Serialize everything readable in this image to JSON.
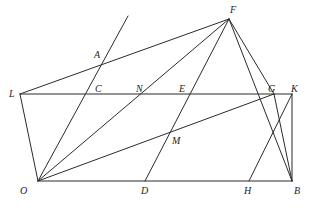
{
  "figure": {
    "width": 314,
    "height": 210,
    "background_color": "#ffffff",
    "stroke_color": "#2b2b2b",
    "label_color": "#1d1d1d",
    "stroke_width": 1,
    "label_font_size": 10,
    "points": {
      "L": {
        "label": "L",
        "x": 20,
        "y": 94,
        "label_x": 9,
        "label_y": 89
      },
      "O": {
        "label": "O",
        "x": 38,
        "y": 181,
        "label_x": 20,
        "label_y": 186
      },
      "A": {
        "label": "A",
        "x": 103,
        "y": 60,
        "label_x": 94,
        "label_y": 50
      },
      "C": {
        "label": "C",
        "x": 100,
        "y": 94,
        "label_x": 95,
        "label_y": 84
      },
      "N": {
        "label": "N",
        "x": 142,
        "y": 94,
        "label_x": 136,
        "label_y": 84
      },
      "E": {
        "label": "E",
        "x": 185,
        "y": 94,
        "label_x": 179,
        "label_y": 84
      },
      "M": {
        "label": "M",
        "x": 172,
        "y": 134,
        "label_x": 172,
        "label_y": 136
      },
      "D": {
        "label": "D",
        "x": 145,
        "y": 181,
        "label_x": 141,
        "label_y": 186
      },
      "H": {
        "label": "H",
        "x": 249,
        "y": 181,
        "label_x": 244,
        "label_y": 186
      },
      "B": {
        "label": "B",
        "x": 292,
        "y": 181,
        "label_x": 294,
        "label_y": 186
      },
      "F": {
        "label": "F",
        "x": 229,
        "y": 19,
        "label_x": 230,
        "label_y": 5
      },
      "G": {
        "label": "G",
        "x": 274,
        "y": 94,
        "label_x": 268,
        "label_y": 84
      },
      "K": {
        "label": "K",
        "x": 292,
        "y": 94,
        "label_x": 291,
        "label_y": 84
      },
      "T": {
        "label": "",
        "x": 128,
        "y": 16,
        "label_x": 0,
        "label_y": 0
      }
    },
    "segments": [
      {
        "name": "segment-L-F",
        "from": "L",
        "to": "F",
        "x1": 20,
        "y1": 94,
        "x2": 229,
        "y2": 19
      },
      {
        "name": "segment-L-K",
        "from": "L",
        "to": "K",
        "x1": 20,
        "y1": 94,
        "x2": 292,
        "y2": 94
      },
      {
        "name": "segment-L-O",
        "from": "L",
        "to": "O",
        "x1": 20,
        "y1": 94,
        "x2": 38,
        "y2": 181
      },
      {
        "name": "segment-O-B",
        "from": "O",
        "to": "B",
        "x1": 38,
        "y1": 181,
        "x2": 292,
        "y2": 181
      },
      {
        "name": "segment-K-B",
        "from": "K",
        "to": "B",
        "x1": 292,
        "y1": 94,
        "x2": 292,
        "y2": 181
      },
      {
        "name": "segment-F-G",
        "from": "F",
        "to": "G",
        "x1": 229,
        "y1": 19,
        "x2": 274,
        "y2": 94
      },
      {
        "name": "segment-F-B",
        "from": "F",
        "to": "B",
        "x1": 229,
        "y1": 19,
        "x2": 292,
        "y2": 181
      },
      {
        "name": "segment-F-O",
        "from": "F",
        "to": "O",
        "x1": 229,
        "y1": 19,
        "x2": 38,
        "y2": 181
      },
      {
        "name": "segment-F-D",
        "from": "F",
        "to": "D",
        "x1": 229,
        "y1": 19,
        "x2": 145,
        "y2": 181
      },
      {
        "name": "segment-O-G",
        "from": "O",
        "to": "G",
        "x1": 38,
        "y1": 181,
        "x2": 274,
        "y2": 94
      },
      {
        "name": "segment-K-H",
        "from": "K",
        "to": "H",
        "x1": 292,
        "y1": 94,
        "x2": 249,
        "y2": 181
      },
      {
        "name": "segment-G-B",
        "from": "G",
        "to": "B",
        "x1": 274,
        "y1": 94,
        "x2": 292,
        "y2": 181
      },
      {
        "name": "segment-T-O",
        "from": "T",
        "to": "O",
        "x1": 128,
        "y1": 16,
        "x2": 38,
        "y2": 181
      }
    ]
  }
}
